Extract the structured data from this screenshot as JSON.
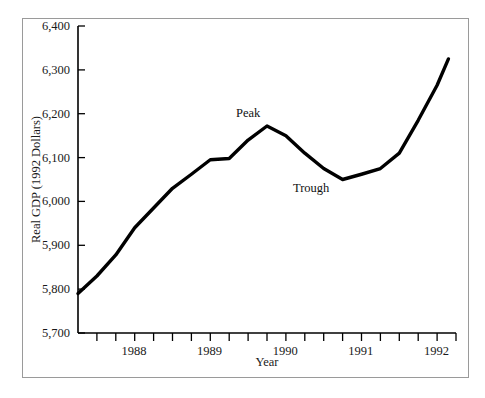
{
  "figure": {
    "frame_color": "#9a9a9a",
    "background": "#ffffff",
    "line_color": "#000000"
  },
  "chart_data": {
    "type": "line",
    "title": "",
    "xlabel": "Year",
    "ylabel": "Real GDP (1992 Dollars)",
    "ylim": [
      5700,
      6400
    ],
    "yticks": [
      5700,
      5800,
      5900,
      6000,
      6100,
      6200,
      6300,
      6400
    ],
    "ytick_labels": [
      "5,700",
      "5,800",
      "5,900",
      "6,000",
      "6,100",
      "6,200",
      "6,300",
      "6,400"
    ],
    "xlim": [
      1987.5,
      1992.5
    ],
    "xtick_labels": [
      "1988",
      "1989",
      "1990",
      "1991",
      "1992"
    ],
    "xticks": [
      1988,
      1989,
      1990,
      1991,
      1992
    ],
    "xtick_minor_interval_quarters": 1,
    "grid": false,
    "legend": null,
    "series": [
      {
        "name": "Real GDP",
        "x": [
          1987.5,
          1987.75,
          1988.0,
          1988.25,
          1988.5,
          1988.75,
          1989.0,
          1989.25,
          1989.5,
          1989.75,
          1990.0,
          1990.25,
          1990.5,
          1990.75,
          1991.0,
          1991.25,
          1991.5,
          1991.75,
          1992.0,
          1992.25,
          1992.4
        ],
        "values": [
          5790,
          5830,
          5878,
          5940,
          5985,
          6030,
          6062,
          6095,
          6098,
          6140,
          6172,
          6150,
          6110,
          6075,
          6050,
          6062,
          6075,
          6110,
          6185,
          6265,
          6325
        ]
      }
    ],
    "annotations": [
      {
        "label": "Peak",
        "x": 1989.75,
        "y": 6172
      },
      {
        "label": "Trough",
        "x": 1991.0,
        "y": 6050
      }
    ]
  }
}
